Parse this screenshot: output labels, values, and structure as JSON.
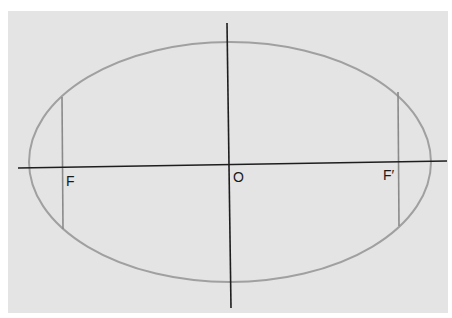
{
  "diagram": {
    "type": "ellipse-with-foci",
    "labels": {
      "left_focus": "F",
      "center": "O",
      "right_focus": "F′"
    },
    "colors": {
      "background_panel": "#e4e4e4",
      "ellipse_stroke": "#9a9a9a",
      "axis_stroke": "#1a1a1a",
      "latus_rectum_stroke": "#8a8a8a"
    },
    "elements": [
      "ellipse",
      "major-axis",
      "minor-axis",
      "latus-rectum-left",
      "latus-rectum-right"
    ]
  }
}
